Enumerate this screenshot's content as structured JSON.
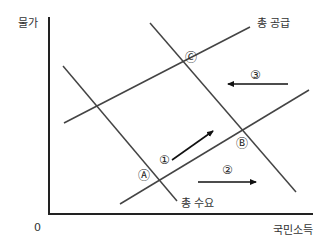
{
  "diagram": {
    "type": "AD-AS macroeconomic diagram",
    "axes": {
      "y_label": "물가",
      "x_label": "국민소득",
      "origin_label": "0"
    },
    "curves": {
      "supply_label": "총 공급",
      "demand_label": "총 수요"
    },
    "points": [
      {
        "id": "A",
        "label": "Ⓐ"
      },
      {
        "id": "B",
        "label": "Ⓑ"
      },
      {
        "id": "C",
        "label": "Ⓒ"
      }
    ],
    "arrows": [
      {
        "id": "1",
        "label": "①",
        "direction": "up-right"
      },
      {
        "id": "2",
        "label": "②",
        "direction": "right"
      },
      {
        "id": "3",
        "label": "③",
        "direction": "left"
      }
    ],
    "colors": {
      "axis": "#222222",
      "curve": "#444444",
      "text": "#333333"
    }
  }
}
